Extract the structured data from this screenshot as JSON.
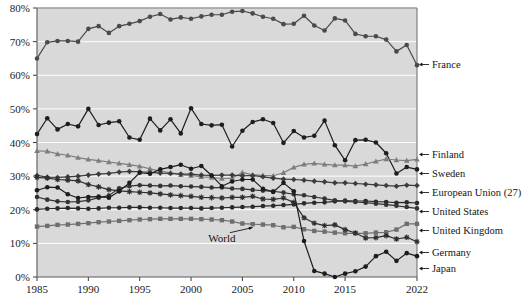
{
  "chart_data": {
    "type": "line",
    "title": "",
    "subtitle": "",
    "xlabel": "",
    "ylabel": "",
    "xlim": [
      1985,
      2022
    ],
    "ylim": [
      0,
      80
    ],
    "grid": true,
    "grid_color": "#ffffff",
    "plot_background": "#d9d9d9",
    "legend_position": "right-inline-annotations",
    "y_ticks": [
      "0%",
      "10%",
      "20%",
      "30%",
      "40%",
      "50%",
      "60%",
      "70%",
      "80%"
    ],
    "y_tick_values": [
      0,
      10,
      20,
      30,
      40,
      50,
      60,
      70,
      80
    ],
    "x_ticks": [
      "1985",
      "1990",
      "1995",
      "2000",
      "2005",
      "2010",
      "2015",
      "2022"
    ],
    "x_tick_values": [
      1985,
      1990,
      1995,
      2000,
      2005,
      2010,
      2015,
      2022
    ],
    "x": [
      1985,
      1986,
      1987,
      1988,
      1989,
      1990,
      1991,
      1992,
      1993,
      1994,
      1995,
      1996,
      1997,
      1998,
      1999,
      2000,
      2001,
      2002,
      2003,
      2004,
      2005,
      2006,
      2007,
      2008,
      2009,
      2010,
      2011,
      2012,
      2013,
      2014,
      2015,
      2016,
      2017,
      2018,
      2019,
      2020,
      2021,
      2022
    ],
    "annotations": [
      {
        "text": "World",
        "x": 2003,
        "y": 10.5,
        "points_to_x": 2006,
        "points_to_y": 15.6
      }
    ],
    "series": [
      {
        "name": "France",
        "label": "France",
        "color": "#4a4a4a",
        "marker": "circle",
        "values": [
          65.0,
          69.8,
          70.2,
          70.2,
          70.0,
          73.8,
          74.6,
          72.6,
          74.6,
          75.3,
          76.1,
          77.4,
          78.2,
          76.6,
          77.2,
          76.8,
          77.5,
          78.0,
          78.0,
          78.9,
          79.1,
          78.4,
          77.4,
          76.8,
          75.2,
          75.3,
          77.7,
          74.8,
          73.3,
          76.9,
          76.3,
          72.3,
          71.6,
          71.6,
          70.6,
          67.1,
          69.0,
          63.0
        ]
      },
      {
        "name": "Sweden",
        "label": "Sweden",
        "color": "#1e1e1e",
        "marker": "circle",
        "values": [
          42.5,
          47.2,
          43.9,
          45.5,
          44.8,
          50.0,
          45.2,
          45.9,
          46.3,
          41.5,
          40.8,
          47.1,
          43.6,
          46.9,
          42.7,
          50.2,
          45.5,
          45.1,
          45.3,
          38.8,
          43.5,
          46.1,
          46.9,
          45.8,
          39.9,
          43.4,
          41.5,
          42.0,
          46.5,
          39.2,
          34.7,
          40.7,
          40.8,
          40.0,
          36.8,
          30.8,
          32.7,
          32.0
        ]
      },
      {
        "name": "Finland",
        "label": "Finland",
        "color": "#7d7d7d",
        "marker": "triangle",
        "values": [
          37.5,
          37.4,
          36.6,
          36.2,
          35.5,
          35.0,
          34.6,
          34.2,
          33.8,
          33.4,
          32.9,
          32.2,
          31.5,
          31.0,
          30.4,
          30.2,
          29.8,
          29.6,
          29.3,
          29.4,
          31.1,
          30.4,
          30.2,
          30.1,
          31.0,
          32.6,
          33.5,
          33.8,
          33.5,
          33.3,
          33.3,
          33.0,
          33.6,
          34.4,
          35.1,
          34.8,
          34.6,
          35.0
        ]
      },
      {
        "name": "European Union (27)",
        "label": "European Union (27)",
        "color": "#3c3c3c",
        "marker": "diamond",
        "values": [
          30.2,
          29.7,
          29.6,
          29.8,
          30.0,
          30.3,
          30.6,
          30.8,
          31.2,
          31.4,
          31.3,
          31.1,
          30.9,
          30.8,
          30.6,
          30.6,
          30.3,
          30.2,
          30.3,
          30.3,
          30.1,
          30.2,
          29.8,
          29.4,
          29.1,
          29.0,
          28.8,
          28.5,
          28.3,
          28.0,
          28.0,
          27.8,
          27.6,
          27.4,
          27.2,
          27.0,
          27.3,
          27.2
        ]
      },
      {
        "name": "United States",
        "label": "United States",
        "color": "#2a2a2a",
        "marker": "circle",
        "values": [
          20.1,
          20.3,
          20.4,
          20.5,
          20.4,
          20.3,
          20.4,
          20.6,
          20.6,
          20.7,
          20.7,
          20.6,
          20.6,
          20.5,
          20.5,
          20.5,
          20.4,
          20.5,
          20.6,
          20.7,
          20.8,
          20.9,
          21.1,
          21.2,
          21.4,
          21.6,
          21.9,
          22.1,
          22.2,
          22.5,
          22.7,
          22.6,
          22.6,
          22.4,
          22.3,
          22.1,
          22.2,
          22.0
        ]
      },
      {
        "name": "United Kingdom",
        "label": "United Kingdom",
        "color": "#333333",
        "marker": "circle",
        "values": [
          23.8,
          23.0,
          22.5,
          22.3,
          22.4,
          22.8,
          23.6,
          24.2,
          26.4,
          27.0,
          27.3,
          27.2,
          27.1,
          27.2,
          27.0,
          26.9,
          26.8,
          26.6,
          26.6,
          26.3,
          26.2,
          25.9,
          25.7,
          25.5,
          25.1,
          24.6,
          24.3,
          23.8,
          23.3,
          22.8,
          22.5,
          22.3,
          22.1,
          21.8,
          21.5,
          21.2,
          20.8,
          20.4
        ]
      },
      {
        "name": "World",
        "label": "World",
        "color": "#6e6e6e",
        "marker": "square",
        "values": [
          15.0,
          15.2,
          15.5,
          15.6,
          15.8,
          16.0,
          16.3,
          16.5,
          16.7,
          16.9,
          17.1,
          17.2,
          17.3,
          17.3,
          17.3,
          17.3,
          17.2,
          17.1,
          16.9,
          16.5,
          15.9,
          15.7,
          15.6,
          15.4,
          14.8,
          14.9,
          14.2,
          13.7,
          13.5,
          13.2,
          13.0,
          13.0,
          13.0,
          13.2,
          13.3,
          14.1,
          15.8,
          15.8
        ]
      },
      {
        "name": "Germany",
        "label": "Germany",
        "color": "#2f2f2f",
        "marker": "star",
        "values": [
          29.6,
          29.4,
          29.0,
          28.8,
          28.6,
          27.5,
          26.8,
          26.0,
          25.6,
          25.4,
          25.2,
          25.0,
          24.7,
          24.4,
          24.2,
          24.0,
          23.7,
          23.6,
          23.5,
          23.7,
          23.7,
          24.0,
          23.2,
          23.1,
          23.5,
          22.2,
          17.6,
          16.0,
          15.3,
          15.5,
          14.1,
          13.1,
          11.6,
          11.7,
          12.3,
          11.3,
          11.8,
          10.5
        ]
      },
      {
        "name": "Japan",
        "label": "Japan",
        "color": "#1c1c1c",
        "marker": "circle",
        "values": [
          25.8,
          26.7,
          26.6,
          24.6,
          23.5,
          23.8,
          23.9,
          23.6,
          25.5,
          28.0,
          31.0,
          30.7,
          32.0,
          32.7,
          33.4,
          32.2,
          33.0,
          30.2,
          27.0,
          28.4,
          29.0,
          29.0,
          26.2,
          25.3,
          28.0,
          25.5,
          10.7,
          1.8,
          1.0,
          0.0,
          1.0,
          1.7,
          3.1,
          6.2,
          7.5,
          4.8,
          7.1,
          6.2
        ]
      }
    ]
  },
  "legend": {
    "items": [
      {
        "label": "France",
        "y": 68
      },
      {
        "label": "Finland",
        "y": 158
      },
      {
        "label": "Sweden",
        "y": 177
      },
      {
        "label": "European Union (27)",
        "y": 196
      },
      {
        "label": "United States",
        "y": 215
      },
      {
        "label": "United Kingdom",
        "y": 234
      },
      {
        "label": "Germany",
        "y": 256
      },
      {
        "label": "Japan",
        "y": 272
      }
    ]
  }
}
